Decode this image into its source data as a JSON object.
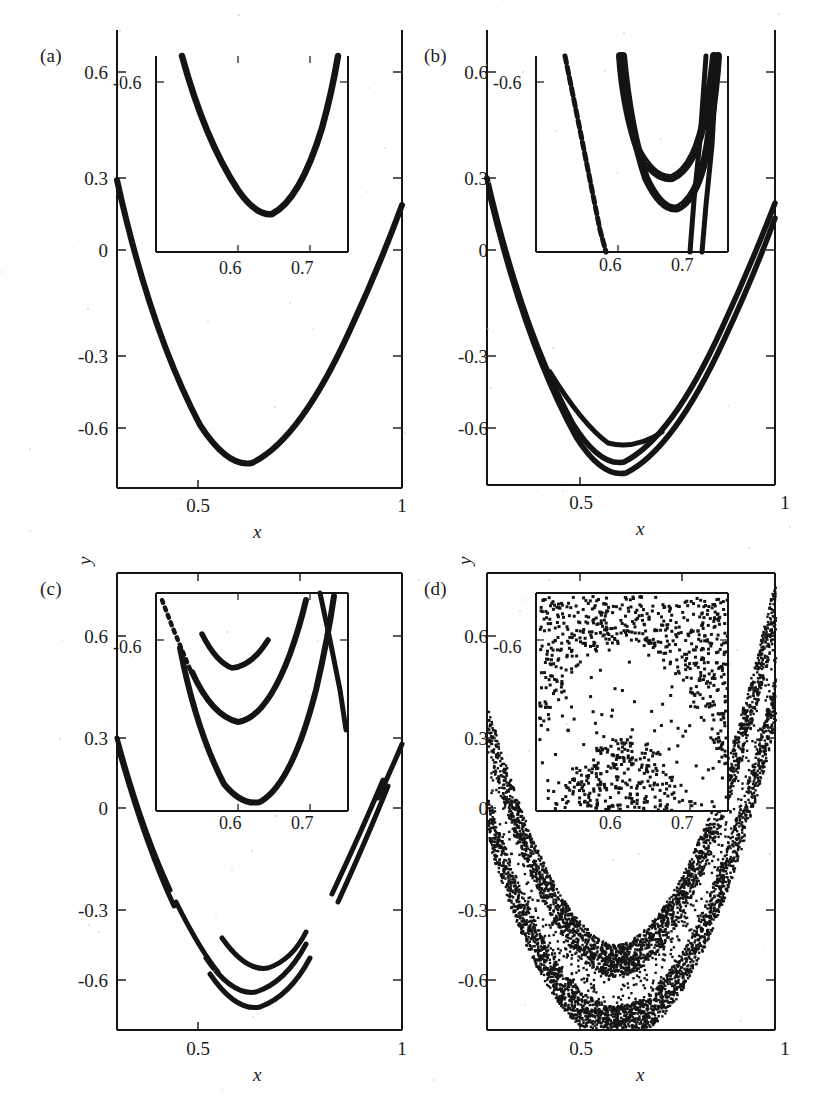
{
  "figure": {
    "caption": "",
    "background": "#ffffff",
    "ink_color": "#141414"
  },
  "axes": {
    "x_label": "x",
    "y_label": "y",
    "x_ticks": [
      "0.5",
      "1"
    ],
    "x_tick_values": [
      0.5,
      1.0
    ],
    "y_ticks": [
      "0.6",
      "0.3",
      "0",
      "-0.3",
      "-0.6"
    ],
    "y_tick_values": [
      0.6,
      0.3,
      0.0,
      -0.3,
      -0.6
    ],
    "xlim": [
      0.35,
      1.0
    ],
    "ylim": [
      -0.78,
      0.72
    ]
  },
  "inset_axes": {
    "x_ticks": [
      "0.6",
      "0.7"
    ],
    "x_tick_values": [
      0.6,
      0.7
    ],
    "y_ticks": [
      "-0.6"
    ],
    "y_tick_values": [
      -0.6
    ],
    "xlim": [
      0.545,
      0.735
    ],
    "ylim": [
      -0.73,
      -0.5
    ]
  },
  "panels": [
    {
      "id": "a",
      "label": "(a)",
      "description": "period-1 single smooth parabolic branch",
      "branches": 1,
      "chaotic": false
    },
    {
      "id": "b",
      "label": "(b)",
      "description": "period-2 doubled branch, bands thickened",
      "branches": 2,
      "chaotic": false
    },
    {
      "id": "c",
      "label": "(c)",
      "description": "period-4 multiple nested parabolic branches with gaps",
      "branches": 4,
      "chaotic": false
    },
    {
      "id": "d",
      "label": "(d)",
      "description": "fully developed chaotic attractor, dense speckled bands",
      "branches": 0,
      "chaotic": true
    }
  ],
  "chart_data": {
    "type": "scatter",
    "xlabel": "x",
    "ylabel": "y",
    "xlim": [
      0.35,
      1.0
    ],
    "ylim": [
      -0.78,
      0.72
    ],
    "xticks": [
      0.5,
      1.0
    ],
    "xticklabels": [
      "0.5",
      "1"
    ],
    "yticks": [
      0.6,
      0.3,
      0.0,
      -0.3,
      -0.6
    ],
    "yticklabels": [
      "0.6",
      "0.3",
      "0",
      "-0.3",
      "-0.6"
    ],
    "grid": false,
    "legend": null,
    "marker_color": "#141414",
    "panel_layout": "2x2",
    "inset": {
      "xlim": [
        0.545,
        0.735
      ],
      "ylim": [
        -0.73,
        -0.5
      ],
      "xticks": [
        0.6,
        0.7
      ],
      "xticklabels": [
        "0.6",
        "0.7"
      ],
      "yticks": [
        -0.6
      ],
      "yticklabels": [
        "-0.6"
      ],
      "position": "upper-center"
    },
    "series": [
      {
        "name": "(a) period-1",
        "panel": "a",
        "curve": "parabola",
        "vertex": [
          0.637,
          -0.645
        ],
        "curvature": 7.0,
        "thickness": 1,
        "note": "single sharp parabolic arc from (0.35,0.13) to (1.0,0.22)"
      },
      {
        "name": "(b) period-2",
        "panel": "b",
        "curve": "parabola-pair",
        "vertices": [
          [
            0.632,
            -0.6
          ],
          [
            0.637,
            -0.7
          ]
        ],
        "curvature": 7.0,
        "thickness": 2,
        "note": "two nested parabolic branches that separate near the vertex"
      },
      {
        "name": "(c) period-4",
        "panel": "c",
        "curve": "parabola-multi",
        "vertices": [
          [
            0.63,
            -0.585
          ],
          [
            0.634,
            -0.625
          ],
          [
            0.637,
            -0.715
          ]
        ],
        "curvature": 7.0,
        "thickness": 3,
        "note": "several nested branches with visible gaps along the arms"
      },
      {
        "name": "(d) chaotic band",
        "panel": "d",
        "curve": "parabolic-band",
        "vertex": [
          0.62,
          -0.68
        ],
        "band_width": 0.09,
        "point_count": 9000,
        "note": "dense chaotic cloud filling a thick parabolic band with an inner white gap"
      }
    ]
  }
}
